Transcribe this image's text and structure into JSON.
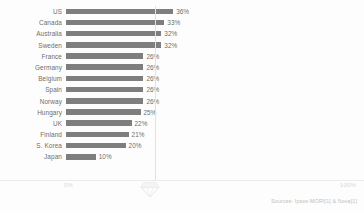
{
  "chart_data": {
    "type": "bar",
    "orientation": "horizontal",
    "title": "",
    "xlabel": "",
    "ylabel": "",
    "xlim": [
      0,
      100
    ],
    "grid": true,
    "legend": null,
    "categories": [
      "US",
      "Canada",
      "Australia",
      "Sweden",
      "France",
      "Germany",
      "Belgium",
      "Spain",
      "Norway",
      "Hungary",
      "UK",
      "Finland",
      "S. Korea",
      "Japan"
    ],
    "values": [
      36,
      33,
      32,
      32,
      26,
      26,
      26,
      26,
      26,
      25,
      22,
      21,
      20,
      10
    ],
    "value_labels": [
      "36%",
      "33%",
      "32%",
      "32%",
      "26%",
      "26%",
      "26%",
      "26%",
      "26%",
      "25%",
      "22%",
      "21%",
      "20%",
      "10%"
    ],
    "rows": [
      {
        "label": "US",
        "value": 36,
        "value_label": "36%"
      },
      {
        "label": "Canada",
        "value": 33,
        "value_label": "33%"
      },
      {
        "label": "Australia",
        "value": 32,
        "value_label": "32%"
      },
      {
        "label": "Sweden",
        "value": 32,
        "value_label": "32%"
      },
      {
        "label": "France",
        "value": 26,
        "value_label": "26%"
      },
      {
        "label": "Germany",
        "value": 26,
        "value_label": "26%"
      },
      {
        "label": "Belgium",
        "value": 26,
        "value_label": "26%"
      },
      {
        "label": "Spain",
        "value": 26,
        "value_label": "26%"
      },
      {
        "label": "Norway",
        "value": 26,
        "value_label": "26%"
      },
      {
        "label": "Hungary",
        "value": 25,
        "value_label": "25%"
      },
      {
        "label": "UK",
        "value": 22,
        "value_label": "22%"
      },
      {
        "label": "Finland",
        "value": 21,
        "value_label": "21%"
      },
      {
        "label": "S. Korea",
        "value": 20,
        "value_label": "20%"
      },
      {
        "label": "Japan",
        "value": 10,
        "value_label": "10%"
      }
    ],
    "axis": {
      "left_label": "0%",
      "right_label": "100%"
    },
    "colors": {
      "bar": "#7e7e7e",
      "text": "#6d6d6d",
      "axis_text": "#d8d8d8",
      "gridline": "#e2e2e2",
      "background": "#fdfdfd"
    }
  },
  "footer": {
    "source": "Sources: Ipsos-MORI[1] & Nova[1]"
  },
  "watermark": {
    "icon": "diamond-icon"
  }
}
